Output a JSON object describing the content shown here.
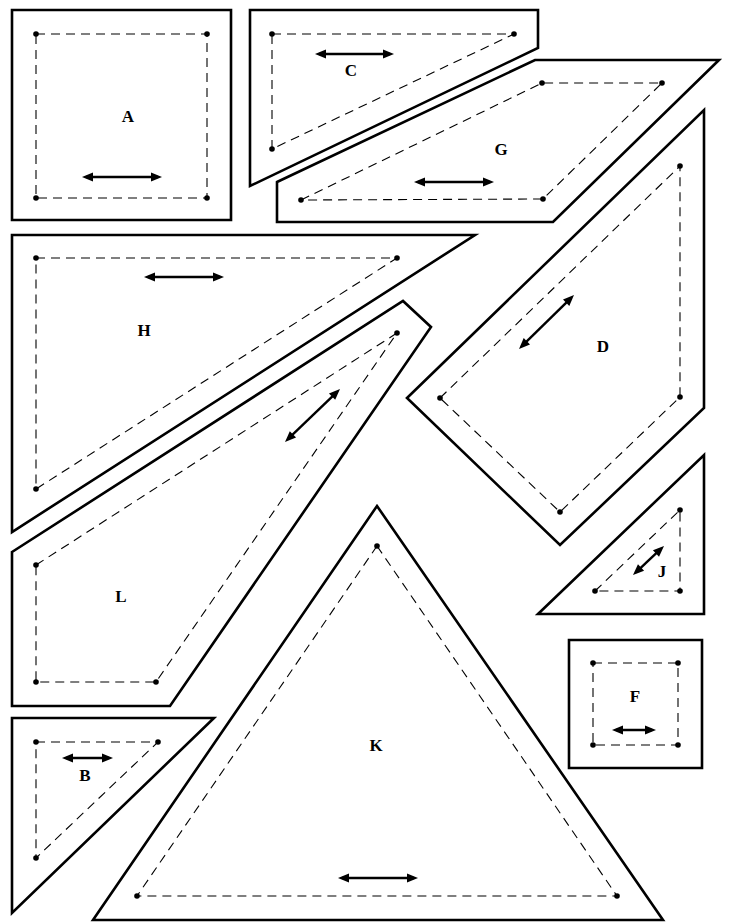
{
  "diagram": {
    "legend": {
      "solid_line": "cutting line",
      "dashed_line": "seam line",
      "arrow": "grain line"
    },
    "pieces": [
      {
        "label": "A",
        "cut": [
          [
            12,
            10
          ],
          [
            231,
            10
          ],
          [
            231,
            220
          ],
          [
            12,
            220
          ]
        ],
        "sew": [
          [
            36,
            34
          ],
          [
            207,
            34
          ],
          [
            207,
            198
          ],
          [
            36,
            198
          ]
        ],
        "arrow": [
          [
            82,
            177
          ],
          [
            162,
            177
          ]
        ],
        "label_pos": [
          128,
          118
        ]
      },
      {
        "label": "C",
        "cut": [
          [
            250,
            10
          ],
          [
            538,
            10
          ],
          [
            538,
            48
          ],
          [
            250,
            186
          ]
        ],
        "sew": [
          [
            272,
            34
          ],
          [
            514,
            34
          ],
          [
            272,
            149
          ]
        ],
        "arrow": [
          [
            315,
            54
          ],
          [
            394,
            54
          ]
        ],
        "label_pos": [
          351,
          72
        ]
      },
      {
        "label": "G",
        "cut": [
          [
            277,
            182
          ],
          [
            535,
            60
          ],
          [
            719,
            60
          ],
          [
            553,
            222
          ],
          [
            277,
            222
          ]
        ],
        "sew": [
          [
            301,
            200
          ],
          [
            542,
            83
          ],
          [
            662,
            83
          ],
          [
            543,
            199
          ]
        ],
        "arrow": [
          [
            414,
            182
          ],
          [
            494,
            182
          ]
        ],
        "label_pos": [
          501,
          151
        ]
      },
      {
        "label": "H",
        "cut": [
          [
            12,
            235
          ],
          [
            475,
            235
          ],
          [
            12,
            532
          ]
        ],
        "sew": [
          [
            36,
            258
          ],
          [
            397,
            258
          ],
          [
            36,
            489
          ]
        ],
        "arrow": [
          [
            144,
            277
          ],
          [
            224,
            277
          ]
        ],
        "label_pos": [
          144,
          332
        ]
      },
      {
        "label": "D",
        "cut": [
          [
            407,
            398
          ],
          [
            704,
            110
          ],
          [
            704,
            408
          ],
          [
            560,
            545
          ]
        ],
        "sew": [
          [
            440,
            398
          ],
          [
            680,
            166
          ],
          [
            680,
            397
          ],
          [
            560,
            512
          ]
        ],
        "arrow": [
          [
            519,
            349
          ],
          [
            574,
            295
          ]
        ],
        "label_pos": [
          603,
          348
        ]
      },
      {
        "label": "L",
        "cut": [
          [
            12,
            552
          ],
          [
            403,
            301
          ],
          [
            431,
            327
          ],
          [
            170,
            706
          ],
          [
            12,
            706
          ]
        ],
        "sew": [
          [
            36,
            565
          ],
          [
            397,
            333
          ],
          [
            156,
            682
          ],
          [
            36,
            682
          ]
        ],
        "arrow": [
          [
            285,
            442
          ],
          [
            340,
            389
          ]
        ],
        "label_pos": [
          121,
          598
        ]
      },
      {
        "label": "J",
        "cut": [
          [
            538,
            614
          ],
          [
            704,
            455
          ],
          [
            704,
            614
          ]
        ],
        "sew": [
          [
            595,
            591
          ],
          [
            680,
            510
          ],
          [
            680,
            591
          ]
        ],
        "arrow": [
          [
            633,
            575
          ],
          [
            664,
            546
          ]
        ],
        "label_pos": [
          662,
          573
        ]
      },
      {
        "label": "F",
        "cut": [
          [
            569,
            640
          ],
          [
            702,
            640
          ],
          [
            702,
            768
          ],
          [
            569,
            768
          ]
        ],
        "sew": [
          [
            593,
            663
          ],
          [
            678,
            663
          ],
          [
            678,
            745
          ],
          [
            593,
            745
          ]
        ],
        "arrow": [
          [
            612,
            730
          ],
          [
            656,
            730
          ]
        ],
        "label_pos": [
          635,
          698
        ]
      },
      {
        "label": "B",
        "cut": [
          [
            12,
            718
          ],
          [
            214,
            718
          ],
          [
            12,
            913
          ]
        ],
        "sew": [
          [
            36,
            742
          ],
          [
            158,
            742
          ],
          [
            36,
            858
          ]
        ],
        "arrow": [
          [
            62,
            758
          ],
          [
            113,
            758
          ]
        ],
        "label_pos": [
          85,
          777
        ]
      },
      {
        "label": "K",
        "cut": [
          [
            377,
            506
          ],
          [
            663,
            920
          ],
          [
            93,
            920
          ]
        ],
        "sew": [
          [
            377,
            546
          ],
          [
            617,
            896
          ],
          [
            137,
            896
          ]
        ],
        "arrow": [
          [
            338,
            878
          ],
          [
            418,
            878
          ]
        ],
        "label_pos": [
          376,
          747
        ]
      }
    ]
  }
}
